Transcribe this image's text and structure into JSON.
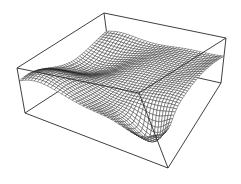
{
  "chart_data": {
    "type": "surface",
    "title": "",
    "xlabel": "",
    "ylabel": "",
    "zlabel": "",
    "axes_ticks": false,
    "grid": false,
    "legend": null,
    "style": "wireframe mesh, hidden-line removed, black on white",
    "mesh_resolution": [
      40,
      40
    ],
    "surface": "wavy sinusoidal landscape: z = 0.5 + 0.18*sin(3.2x+0.6)*cos(2.6y) + 0.12*sin(5y+1.4x) + 0.08*cos(4.5x-2y), dipping lowest near the front corner",
    "box": {
      "top": {
        "left": [
          17,
          68
        ],
        "back": [
          104,
          13
        ],
        "right": [
          226,
          38
        ],
        "front": [
          139,
          93
        ]
      },
      "bottom": {
        "left": [
          25,
          113
        ],
        "back": [
          110,
          58
        ],
        "right": [
          221,
          83
        ],
        "front": [
          168,
          168
        ]
      }
    },
    "colors": {
      "line": "#1a1a1a",
      "box": "#2a2a2a",
      "background": "#ffffff"
    }
  }
}
